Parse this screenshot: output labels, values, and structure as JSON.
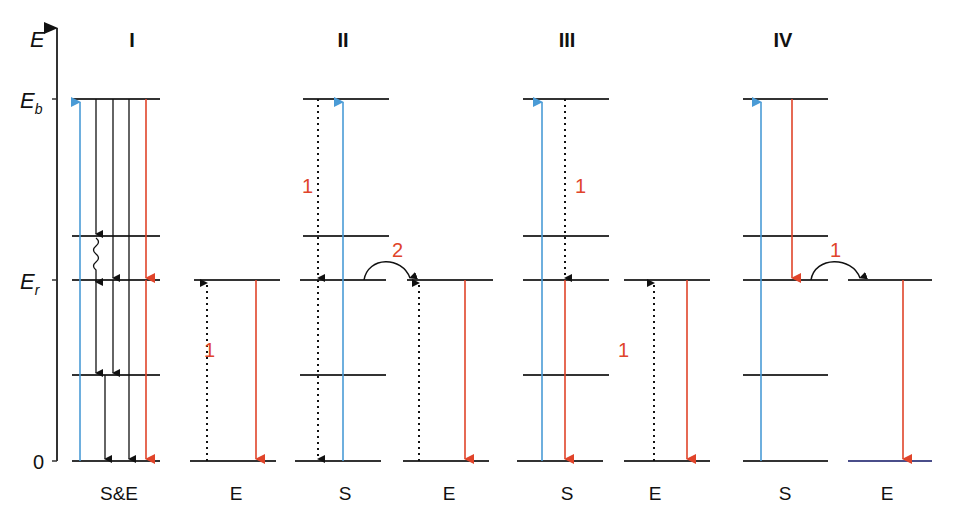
{
  "axis": {
    "label": "E",
    "ticks": [
      {
        "main": "E",
        "sub": "b",
        "y": 99
      },
      {
        "main": "E",
        "sub": "r",
        "y": 280
      },
      {
        "main": "0",
        "sub": "",
        "y": 461
      }
    ]
  },
  "panels": [
    {
      "id": "I",
      "title": "I",
      "title_x": 132
    },
    {
      "id": "II",
      "title": "II",
      "title_x": 343
    },
    {
      "id": "III",
      "title": "III",
      "title_x": 567
    },
    {
      "id": "IV",
      "title": "IV",
      "title_x": 783
    }
  ],
  "columns": [
    {
      "label": "S&E",
      "x": 119
    },
    {
      "label": "E",
      "x": 236
    },
    {
      "label": "S",
      "x": 345
    },
    {
      "label": "E",
      "x": 449
    },
    {
      "label": "S",
      "x": 567
    },
    {
      "label": "E",
      "x": 655
    },
    {
      "label": "S",
      "x": 785
    },
    {
      "label": "E",
      "x": 887
    }
  ],
  "step_labels": [
    {
      "text": "1",
      "x": 204,
      "y": 350
    },
    {
      "text": "1",
      "x": 308,
      "y": 187
    },
    {
      "text": "2",
      "x": 398,
      "y": 250
    },
    {
      "text": "1",
      "x": 578,
      "y": 187
    },
    {
      "text": "1",
      "x": 624,
      "y": 350
    },
    {
      "text": "1",
      "x": 834,
      "y": 250
    }
  ],
  "colors": {
    "excitation": "#4a9bd6",
    "emission": "#e0442a",
    "level": "#333333",
    "step_label": "#e0442a"
  }
}
